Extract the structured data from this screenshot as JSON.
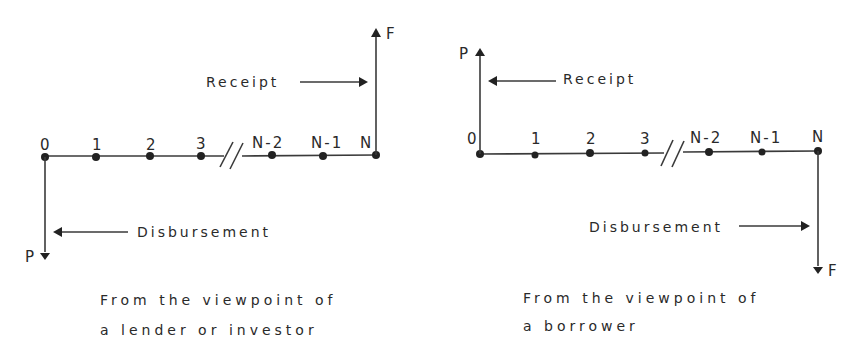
{
  "diagrams": [
    {
      "id": "lender",
      "period_labels": [
        "0",
        "1",
        "2",
        "3",
        "N-2",
        "N-1",
        "N"
      ],
      "break_mark": "//",
      "receipt": {
        "label": "Receipt",
        "symbol": "F",
        "direction": "up",
        "at_period": "N"
      },
      "disbursement": {
        "label": "Disbursement",
        "symbol": "P",
        "direction": "down",
        "at_period": "0"
      },
      "caption_line1": "From the viewpoint of",
      "caption_line2": "a lender or investor"
    },
    {
      "id": "borrower",
      "period_labels": [
        "0",
        "1",
        "2",
        "3",
        "N-2",
        "N-1",
        "N"
      ],
      "break_mark": "//",
      "receipt": {
        "label": "Receipt",
        "symbol": "P",
        "direction": "up",
        "at_period": "0"
      },
      "disbursement": {
        "label": "Disbursement",
        "symbol": "F",
        "direction": "down",
        "at_period": "N"
      },
      "caption_line1": "From the viewpoint of",
      "caption_line2": "a borrower"
    }
  ],
  "colors": {
    "ink": "#2a2a2a",
    "background": "#ffffff"
  }
}
